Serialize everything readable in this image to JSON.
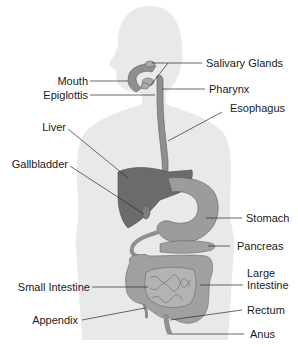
{
  "diagram": {
    "colors": {
      "silhouette": "#e9e9e9",
      "organ_dark": "#6b6b6b",
      "organ_mid": "#8f8f8f",
      "organ_light": "#a9a9a9",
      "leader_line": "#2a2a2a",
      "label_text": "#1a1a1a"
    },
    "labels": {
      "salivary_glands": "Salivary Glands",
      "mouth": "Mouth",
      "pharynx": "Pharynx",
      "epiglottis": "Epiglottis",
      "esophagus": "Esophagus",
      "liver": "Liver",
      "gallbladder": "Gallbladder",
      "stomach": "Stomach",
      "pancreas": "Pancreas",
      "small_intestine": "Small Intestine",
      "large_intestine_line1": "Large",
      "large_intestine_line2": "Intestine",
      "appendix": "Appendix",
      "rectum": "Rectum",
      "anus": "Anus"
    }
  }
}
